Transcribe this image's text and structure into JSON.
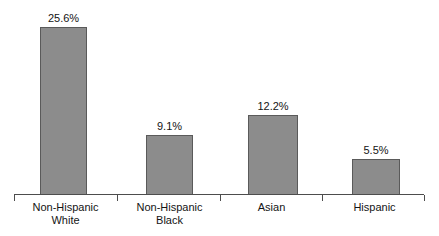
{
  "chart_data": {
    "type": "bar",
    "title": "",
    "subtitle": "",
    "xlabel": "",
    "ylabel": "",
    "categories": [
      "Non-Hispanic White",
      "Non-Hispanic Black",
      "Asian",
      "Hispanic"
    ],
    "category_lines": [
      [
        "Non-Hispanic",
        "White"
      ],
      [
        "Non-Hispanic",
        "Black"
      ],
      [
        "Asian"
      ],
      [
        "Hispanic"
      ]
    ],
    "values": [
      25.6,
      9.1,
      12.2,
      5.5
    ],
    "value_labels": [
      "25.6%",
      "9.1%",
      "12.2%",
      "5.5%"
    ],
    "ylim": [
      0,
      27.5
    ],
    "grid": false,
    "legend": false,
    "y_axis_visible": false,
    "x_axis_visible": true,
    "bar_color": "#8c8c8c",
    "bar_border_color": "#5a5a5a",
    "axis_color": "#4d4d4d",
    "text_color": "#141414",
    "background": "#ffffff"
  },
  "geometry": {
    "baseline_y": 195,
    "axis_left_x": 14,
    "axis_right_x": 424,
    "px_per_unit": 6.56,
    "bars": [
      {
        "left": 40,
        "width": 47
      },
      {
        "left": 146,
        "width": 47
      },
      {
        "left": 248,
        "width": 50
      },
      {
        "left": 352,
        "width": 48
      }
    ],
    "ticks_x": [
      14,
      117,
      220,
      322,
      424
    ],
    "category_centers": [
      65,
      170,
      272,
      376
    ]
  }
}
